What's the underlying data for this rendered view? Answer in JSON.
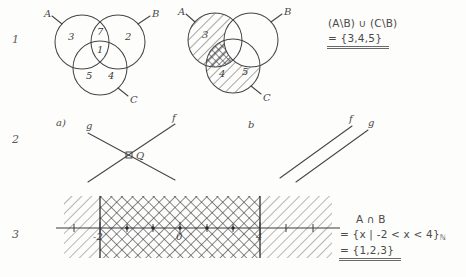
{
  "page": {
    "background": "#fdfdfc",
    "ink": "#46464a",
    "width": 466,
    "height": 277
  },
  "rows": [
    {
      "marker": "1"
    },
    {
      "marker": "2"
    },
    {
      "marker": "3"
    }
  ],
  "exercise1": {
    "venn_plain": {
      "set_labels": {
        "a": "A",
        "b": "B",
        "c": "C"
      },
      "region_values": {
        "a_only": "3",
        "b_only": "2",
        "a_and_b": "7",
        "a_b_c": "1",
        "a_and_c": "5",
        "b_and_c": "4"
      }
    },
    "venn_shaded": {
      "set_labels": {
        "a": "A",
        "b": "B",
        "c": "C"
      },
      "region_values": {
        "a_only": "3",
        "a_and_c": "4",
        "b_and_c": "5"
      },
      "shaded_regions": [
        "a-minus-b",
        "c-minus-b"
      ],
      "crosshatched_regions": [
        "a-and-c-minus-b"
      ]
    },
    "answer": {
      "expression": "(A\\B) ∪ (C\\B)",
      "result": "= {3,4,5}"
    }
  },
  "exercise2": {
    "part_a": {
      "label": "a)",
      "line_left_label": "g",
      "line_right_label": "f",
      "intersection_label": "Q",
      "relation": "intersecting"
    },
    "part_b": {
      "label": "b",
      "line_left_label": "f",
      "line_right_label": "g",
      "relation": "parallel"
    }
  },
  "exercise3": {
    "numberline": {
      "tick_labels": [
        "-2",
        "0",
        "4"
      ],
      "interval_start": "-2",
      "interval_end": "4",
      "band_fill": "crosshatch",
      "outside_fill": "diagonal-hatch"
    },
    "answer": {
      "expression": "A ∩ B",
      "setbuilder_prefix": "= {x | -2 < x < 4}",
      "setbuilder_subscript": "ℕ",
      "result": "= {1,2,3}"
    }
  }
}
